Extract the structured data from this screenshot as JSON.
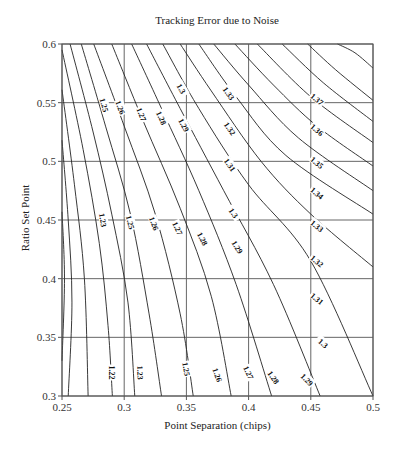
{
  "chart_data": {
    "type": "contour",
    "title": "Tracking Error due to Noise",
    "xlabel": "Point Separation (chips)",
    "ylabel": "Ratio Set Point",
    "xlim": [
      0.25,
      0.5
    ],
    "ylim": [
      0.3,
      0.6
    ],
    "xticks": [
      "0.25",
      "0.3",
      "0.35",
      "0.4",
      "0.45",
      "0.5"
    ],
    "yticks": [
      "0.6",
      "0.55",
      "0.5",
      "0.45",
      "0.4",
      "0.35",
      "0.3"
    ],
    "grid": true,
    "contour_levels": [
      1.22,
      1.23,
      1.24,
      1.25,
      1.26,
      1.27,
      1.28,
      1.29,
      1.3,
      1.31,
      1.32,
      1.33,
      1.34,
      1.35,
      1.36,
      1.37
    ],
    "contours": [
      {
        "level": 1.37,
        "points": [
          [
            0.4715,
            0.6
          ],
          [
            0.4855,
            0.5925
          ],
          [
            0.5,
            0.5795
          ]
        ]
      },
      {
        "level": 1.36,
        "points": [
          [
            0.4475,
            0.6
          ],
          [
            0.47,
            0.578
          ],
          [
            0.5,
            0.552
          ]
        ]
      },
      {
        "level": 1.35,
        "points": [
          [
            0.427,
            0.6
          ],
          [
            0.46,
            0.567
          ],
          [
            0.5,
            0.534
          ]
        ]
      },
      {
        "level": 1.34,
        "points": [
          [
            0.407,
            0.6
          ],
          [
            0.45,
            0.555
          ],
          [
            0.5,
            0.516
          ]
        ]
      },
      {
        "level": 1.33,
        "points": [
          [
            0.389,
            0.6
          ],
          [
            0.42,
            0.565
          ],
          [
            0.455,
            0.53
          ],
          [
            0.5,
            0.496
          ]
        ]
      },
      {
        "level": 1.32,
        "points": [
          [
            0.372,
            0.6
          ],
          [
            0.4,
            0.565
          ],
          [
            0.44,
            0.52
          ],
          [
            0.5,
            0.475
          ]
        ]
      },
      {
        "level": 1.31,
        "points": [
          [
            0.36,
            0.6
          ],
          [
            0.39,
            0.555
          ],
          [
            0.43,
            0.505
          ],
          [
            0.5,
            0.455
          ]
        ]
      },
      {
        "level": 1.3,
        "points": [
          [
            0.345,
            0.6
          ],
          [
            0.37,
            0.56
          ],
          [
            0.41,
            0.5
          ],
          [
            0.45,
            0.455
          ],
          [
            0.5,
            0.41
          ]
        ]
      },
      {
        "level": 1.29,
        "points": [
          [
            0.331,
            0.6
          ],
          [
            0.36,
            0.545
          ],
          [
            0.4,
            0.48
          ],
          [
            0.45,
            0.415
          ],
          [
            0.5,
            0.3
          ]
        ]
      },
      {
        "level": 1.28,
        "points": [
          [
            0.318,
            0.6
          ],
          [
            0.345,
            0.545
          ],
          [
            0.38,
            0.475
          ],
          [
            0.42,
            0.395
          ],
          [
            0.4575,
            0.3
          ]
        ]
      },
      {
        "level": 1.27,
        "points": [
          [
            0.306,
            0.6
          ],
          [
            0.33,
            0.545
          ],
          [
            0.36,
            0.475
          ],
          [
            0.39,
            0.395
          ],
          [
            0.4185,
            0.3
          ]
        ]
      },
      {
        "level": 1.26,
        "points": [
          [
            0.29,
            0.6
          ],
          [
            0.315,
            0.535
          ],
          [
            0.345,
            0.46
          ],
          [
            0.37,
            0.385
          ],
          [
            0.386,
            0.3
          ]
        ]
      },
      {
        "level": 1.25,
        "points": [
          [
            0.2755,
            0.6
          ],
          [
            0.3,
            0.53
          ],
          [
            0.325,
            0.455
          ],
          [
            0.345,
            0.37
          ],
          [
            0.3555,
            0.3
          ]
        ]
      },
      {
        "level": 1.24,
        "points": [
          [
            0.2655,
            0.6
          ],
          [
            0.285,
            0.53
          ],
          [
            0.305,
            0.455
          ],
          [
            0.32,
            0.37
          ],
          [
            0.33,
            0.3
          ]
        ]
      },
      {
        "level": 1.23,
        "points": [
          [
            0.2565,
            0.6
          ],
          [
            0.275,
            0.525
          ],
          [
            0.29,
            0.455
          ],
          [
            0.303,
            0.38
          ],
          [
            0.3085,
            0.3
          ]
        ]
      },
      {
        "level": 1.22,
        "points": [
          [
            0.25,
            0.595
          ],
          [
            0.267,
            0.51
          ],
          [
            0.28,
            0.43
          ],
          [
            0.287,
            0.36
          ],
          [
            0.2905,
            0.3
          ]
        ]
      },
      {
        "level": 1.21,
        "points": [
          [
            0.25,
            0.561
          ],
          [
            0.26,
            0.48
          ],
          [
            0.268,
            0.4
          ],
          [
            0.271,
            0.3
          ]
        ]
      },
      {
        "level": 1.2,
        "points": [
          [
            0.25,
            0.518
          ],
          [
            0.255,
            0.45
          ],
          [
            0.258,
            0.38
          ],
          [
            0.255,
            0.3
          ]
        ]
      },
      {
        "level": 1.19,
        "points": [
          [
            0.25,
            0.457
          ],
          [
            0.252,
            0.4
          ],
          [
            0.25,
            0.33
          ]
        ]
      }
    ],
    "labels": [
      {
        "text": "1.37",
        "x": 0.455,
        "y": 0.553,
        "angle": 40
      },
      {
        "text": "1.36",
        "x": 0.455,
        "y": 0.527,
        "angle": 40
      },
      {
        "text": "1.35",
        "x": 0.455,
        "y": 0.499,
        "angle": 40
      },
      {
        "text": "1.34",
        "x": 0.455,
        "y": 0.473,
        "angle": 40
      },
      {
        "text": "1.33",
        "x": 0.455,
        "y": 0.445,
        "angle": 40
      },
      {
        "text": "1.32",
        "x": 0.455,
        "y": 0.415,
        "angle": 40
      },
      {
        "text": "1.31",
        "x": 0.455,
        "y": 0.383,
        "angle": 40
      },
      {
        "text": "1.3",
        "x": 0.46,
        "y": 0.345,
        "angle": 40
      },
      {
        "text": "1.29",
        "x": 0.447,
        "y": 0.314,
        "angle": 45
      },
      {
        "text": "1.28",
        "x": 0.42,
        "y": 0.316,
        "angle": 55
      },
      {
        "text": "1.27",
        "x": 0.4,
        "y": 0.32,
        "angle": 65
      },
      {
        "text": "1.26",
        "x": 0.375,
        "y": 0.318,
        "angle": 70
      },
      {
        "text": "1.25",
        "x": 0.35,
        "y": 0.323,
        "angle": 80
      },
      {
        "text": "1.23",
        "x": 0.313,
        "y": 0.32,
        "angle": 88
      },
      {
        "text": "1.22",
        "x": 0.29,
        "y": 0.32,
        "angle": 90
      },
      {
        "text": "1.25",
        "x": 0.284,
        "y": 0.548,
        "angle": 75
      },
      {
        "text": "1.26",
        "x": 0.297,
        "y": 0.546,
        "angle": 70
      },
      {
        "text": "1.27",
        "x": 0.314,
        "y": 0.54,
        "angle": 68
      },
      {
        "text": "1.28",
        "x": 0.33,
        "y": 0.537,
        "angle": 65
      },
      {
        "text": "1.29",
        "x": 0.348,
        "y": 0.531,
        "angle": 62
      },
      {
        "text": "1.3",
        "x": 0.346,
        "y": 0.562,
        "angle": 60
      },
      {
        "text": "1.33",
        "x": 0.384,
        "y": 0.558,
        "angle": 55
      },
      {
        "text": "1.32",
        "x": 0.385,
        "y": 0.528,
        "angle": 55
      },
      {
        "text": "1.31",
        "x": 0.385,
        "y": 0.497,
        "angle": 55
      },
      {
        "text": "1.3",
        "x": 0.388,
        "y": 0.456,
        "angle": 55
      },
      {
        "text": "1.29",
        "x": 0.391,
        "y": 0.427,
        "angle": 58
      },
      {
        "text": "1.28",
        "x": 0.363,
        "y": 0.434,
        "angle": 62
      },
      {
        "text": "1.27",
        "x": 0.343,
        "y": 0.443,
        "angle": 65
      },
      {
        "text": "1.26",
        "x": 0.324,
        "y": 0.447,
        "angle": 70
      },
      {
        "text": "1.25",
        "x": 0.305,
        "y": 0.448,
        "angle": 75
      },
      {
        "text": "1.23",
        "x": 0.283,
        "y": 0.45,
        "angle": 80
      }
    ]
  }
}
